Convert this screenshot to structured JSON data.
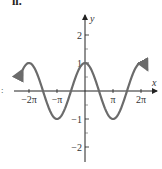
{
  "panel": {
    "label": "ii."
  },
  "left_mark": ":",
  "chart_data": {
    "type": "line",
    "title": "",
    "function": "y = cos(x)",
    "xlabel": "x",
    "ylabel": "y",
    "xlim": [
      -7.3,
      7.6
    ],
    "ylim": [
      -2.5,
      2.7
    ],
    "x_ticks": [
      {
        "value": -6.2832,
        "label": "-2π"
      },
      {
        "value": -3.1416,
        "label": "-π"
      },
      {
        "value": 3.1416,
        "label": "π"
      },
      {
        "value": 6.2832,
        "label": "2π"
      }
    ],
    "y_ticks": [
      {
        "value": 2,
        "label": "2"
      },
      {
        "value": 1,
        "label": "1"
      },
      {
        "value": -1,
        "label": "-1"
      },
      {
        "value": -2,
        "label": "-2"
      }
    ],
    "series": [
      {
        "name": "cos(x)",
        "color": "#6b6b6b",
        "x": [
          -7.0,
          -6.2832,
          -4.7124,
          -3.1416,
          -1.5708,
          0,
          1.5708,
          3.1416,
          4.7124,
          6.2832,
          7.0
        ],
        "y": [
          0.754,
          1,
          0,
          -1,
          0,
          1,
          0,
          -1,
          0,
          1,
          0.754
        ]
      }
    ],
    "grid": false,
    "legend": null,
    "curve_arrows": "both ends"
  }
}
